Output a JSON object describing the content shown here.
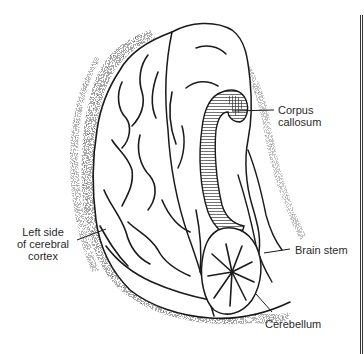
{
  "figure": {
    "style": "black-and-white pen-and-ink anatomical drawing",
    "labels": [
      {
        "id": "corpus",
        "lines": [
          "Corpus",
          "callosum"
        ]
      },
      {
        "id": "cortex",
        "lines": [
          "Left side",
          "of cerebral",
          "cortex"
        ]
      },
      {
        "id": "stem",
        "lines": [
          "Brain stem"
        ]
      },
      {
        "id": "cereb",
        "lines": [
          "Cerebellum"
        ]
      }
    ]
  },
  "colors": {
    "ink": "#1a1a1a",
    "shading": "#8a8a8a",
    "background": "#ffffff",
    "label_text": "#2a2a2a"
  }
}
